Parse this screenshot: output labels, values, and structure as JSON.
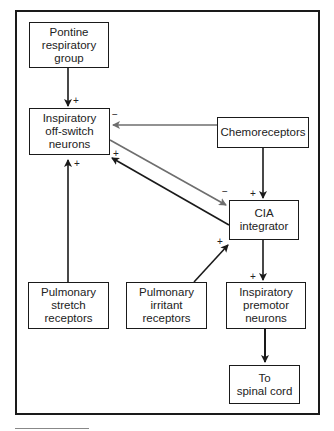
{
  "diagram": {
    "nodes": {
      "pontine": {
        "line1": "Pontine",
        "line2": "respiratory",
        "line3": "group"
      },
      "offswitch": {
        "line1": "Inspiratory",
        "line2": "off-switch",
        "line3": "neurons"
      },
      "chemo": {
        "line1": "Chemoreceptors"
      },
      "cia": {
        "line1": "CIA",
        "line2": "integrator"
      },
      "stretch": {
        "line1": "Pulmonary",
        "line2": "stretch",
        "line3": "receptors"
      },
      "irritant": {
        "line1": "Pulmonary",
        "line2": "irritant",
        "line3": "receptors"
      },
      "premotor": {
        "line1": "Inspiratory",
        "line2": "premotor",
        "line3": "neurons"
      },
      "spinal": {
        "line1": "To",
        "line2": "spinal cord"
      }
    },
    "signs": {
      "pontine_to_offswitch": "+",
      "chemo_to_offswitch": "−",
      "cia_to_offswitch": "+",
      "stretch_to_offswitch": "+",
      "offswitch_to_cia": "−",
      "chemo_to_cia": "+",
      "irritant_to_cia": "+",
      "cia_to_premotor": "+"
    },
    "colors": {
      "dark": "#1a1a1a",
      "gray": "#6e6e6e"
    }
  }
}
